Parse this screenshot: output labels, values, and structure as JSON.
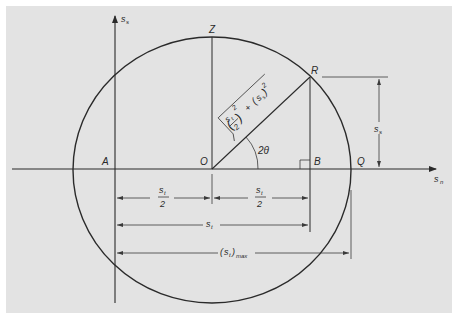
{
  "figure": {
    "type": "Mohr circle for plane stress",
    "background_color": "#e3e3e3",
    "line_color": "#2a2a2a"
  },
  "axes": {
    "vertical_label_main": "s",
    "vertical_label_sub": "s",
    "horizontal_label_main": "s",
    "horizontal_label_sub": "n"
  },
  "points": {
    "A": "A",
    "O": "O",
    "Z": "Z",
    "R": "R",
    "B": "B",
    "Q": "Q"
  },
  "radius_formula": {
    "numerator": "s",
    "numerator_sub": "t",
    "denominator": "2",
    "exp1": "2",
    "plus": "+",
    "term2_open": "(",
    "term2_main": "s",
    "term2_sub": "s",
    "term2_close": ")",
    "exp2": "2"
  },
  "angle_label": "2θ",
  "dimensions": {
    "half_left": {
      "num_main": "s",
      "num_sub": "t",
      "den": "2"
    },
    "half_right": {
      "num_main": "s",
      "num_sub": "t",
      "den": "2"
    },
    "full": {
      "main": "s",
      "sub": "t"
    },
    "max": {
      "open": "(",
      "main": "s",
      "sub": "t",
      "close": ")",
      "sub2": "max"
    },
    "shear": {
      "main": "s",
      "sub": "s"
    }
  }
}
